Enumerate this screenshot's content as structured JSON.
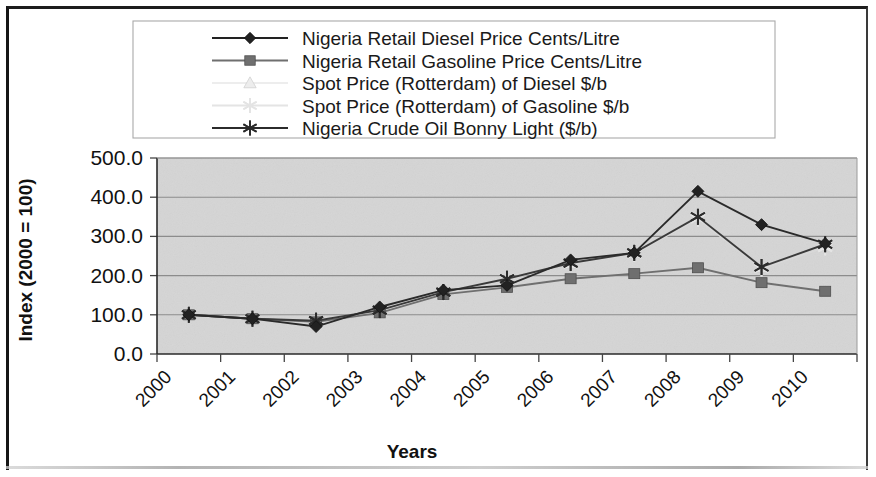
{
  "figure": {
    "plot_background": "#d5d5d5",
    "gridline_color": "#8c8c8c",
    "frame_color": "#161616"
  },
  "legend": {
    "border_color": "#a9a9a9",
    "entries": [
      {
        "label": "Nigeria Retail Diesel Price Cents/Litre",
        "marker": "diamond",
        "color": "#222222"
      },
      {
        "label": "Nigeria Retail Gasoline Price Cents/Litre",
        "marker": "square",
        "color": "#6f6f6f"
      },
      {
        "label": "Spot Price (Rotterdam) of Diesel $/b",
        "marker": "triangle",
        "color": "#ededed"
      },
      {
        "label": "Spot Price (Rotterdam) of Gasoline $/b",
        "marker": "star",
        "color": "#e4e4e4"
      },
      {
        "label": " Nigeria Crude Oil Bonny Light ($/b)",
        "marker": "asterisk",
        "color": "#2b2b2b"
      }
    ]
  },
  "chart_data": {
    "type": "line",
    "title": "",
    "xlabel": "Years",
    "ylabel": "Index (2000 = 100)",
    "grid": true,
    "legend_position": "top",
    "ylim": [
      0,
      500
    ],
    "yticks": [
      "0.0",
      "100.0",
      "200.0",
      "300.0",
      "400.0",
      "500.0"
    ],
    "ytick_values": [
      0,
      100,
      200,
      300,
      400,
      500
    ],
    "categories": [
      "2000",
      "2001",
      "2002",
      "2003",
      "2004",
      "2005",
      "2006",
      "2007",
      "2008",
      "2009",
      "2010"
    ],
    "series": [
      {
        "name": "Nigeria Retail Diesel Price Cents/Litre",
        "marker": "diamond",
        "color": "#222222",
        "line_color": "#2a2a2a",
        "values": [
          100,
          90,
          70,
          120,
          163,
          175,
          240,
          258,
          415,
          330,
          282
        ]
      },
      {
        "name": "Nigeria Retail Gasoline Price Cents/Litre",
        "marker": "square",
        "color": "#6f6f6f",
        "line_color": "#6f6f6f",
        "values": [
          100,
          90,
          82,
          105,
          152,
          170,
          192,
          205,
          220,
          182,
          160
        ]
      },
      {
        "name": "Spot Price (Rotterdam) of Diesel $/b",
        "marker": "triangle",
        "color": "#ededed",
        "line_color": "#dcdcdc",
        "values": [
          100,
          90,
          85,
          112,
          158,
          192,
          232,
          258,
          350,
          222,
          278
        ]
      },
      {
        "name": "Spot Price (Rotterdam) of Gasoline $/b",
        "marker": "star",
        "color": "#e4e4e4",
        "line_color": "#d8d8d8",
        "values": [
          100,
          90,
          85,
          110,
          155,
          190,
          230,
          255,
          345,
          218,
          272
        ]
      },
      {
        "name": " Nigeria Crude Oil Bonny Light ($/b)",
        "marker": "asterisk",
        "color": "#2b2b2b",
        "line_color": "#3a3a3a",
        "values": [
          100,
          90,
          85,
          112,
          158,
          192,
          232,
          258,
          350,
          222,
          280
        ]
      }
    ]
  }
}
